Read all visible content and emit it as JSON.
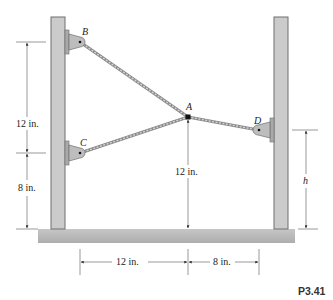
{
  "figure": {
    "id_label": "P3.41",
    "points": {
      "A": "A",
      "B": "B",
      "C": "C",
      "D": "D"
    },
    "dimensions": {
      "left_upper": "12 in.",
      "left_lower": "8 in.",
      "A_height": "12 in.",
      "right_height": "h",
      "bottom_left": "12 in.",
      "bottom_right": "8 in."
    },
    "colors": {
      "post_fill": "#c9c9c9",
      "post_stroke": "#6f6f6f",
      "ground_fill": "#bdbdbd",
      "cable": "#a8a8a8",
      "bracket_fill": "#b9b9b9",
      "dim_line": "#555555"
    }
  }
}
